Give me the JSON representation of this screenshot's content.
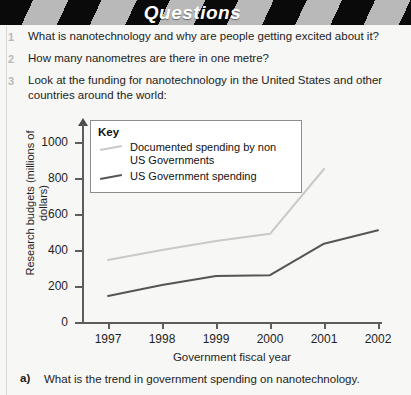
{
  "header": {
    "title": "Questions"
  },
  "questions": [
    {
      "number": "1",
      "text": "What is nanotechnology and why are people getting excited about it?"
    },
    {
      "number": "2",
      "text": "How many nanometres are there in one metre?"
    },
    {
      "number": "3",
      "text": "Look at the funding for nanotechnology in the United States and other countries around the world:"
    }
  ],
  "legend": {
    "key_label": "Key",
    "items": [
      {
        "label": "Documented spending by non US Governments",
        "color": "#c9c9c9"
      },
      {
        "label": "US Government spending",
        "color": "#555555"
      }
    ]
  },
  "footer": {
    "number": "a)",
    "text": "What is the trend in government spending on nanotechnology."
  },
  "chart_data": {
    "type": "line",
    "title": "",
    "xlabel": "Government fiscal year",
    "ylabel": "Research budgets (millions of dollars)",
    "categories": [
      "1997",
      "1998",
      "1999",
      "2000",
      "2001",
      "2002"
    ],
    "ylim": [
      0,
      1000
    ],
    "yticks": [
      0,
      200,
      400,
      600,
      800,
      1000
    ],
    "ytick_labels": [
      "0",
      "200",
      "400",
      "600",
      "800",
      "1000"
    ],
    "grid": false,
    "legend_position": "top-left-inside",
    "series": [
      {
        "name": "Documented spending by non US Governments",
        "color": "#c9c9c9",
        "values": [
          345,
          400,
          450,
          490,
          850,
          null
        ]
      },
      {
        "name": "US Government spending",
        "color": "#555555",
        "values": [
          145,
          205,
          255,
          260,
          435,
          510
        ]
      }
    ]
  }
}
